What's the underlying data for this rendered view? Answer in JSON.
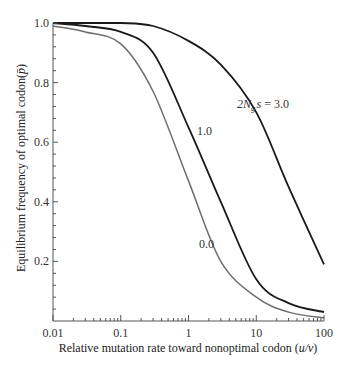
{
  "chart_data": {
    "type": "line",
    "title": "",
    "xlabel": "Relative mutation rate toward nonoptimal codon (u/v)",
    "ylabel": "Equilibrium frequency of optimal codon (p̄)",
    "xscale": "log",
    "xlim": [
      0.01,
      100
    ],
    "ylim": [
      0,
      1.0
    ],
    "x_ticks": [
      "0.01",
      "0.1",
      "1",
      "10",
      "100"
    ],
    "y_ticks": [
      "0.2",
      "0.4",
      "0.6",
      "0.8",
      "1.0"
    ],
    "grid": false,
    "legend": "inline curve labels",
    "x": [
      0.01,
      0.03,
      0.1,
      0.3,
      1,
      3,
      10,
      30,
      100
    ],
    "series": [
      {
        "name": "2Ngs = 3.0",
        "label": "2N_g s = 3.0",
        "values": [
          1.0,
          1.0,
          1.0,
          0.99,
          0.94,
          0.86,
          0.7,
          0.45,
          0.19
        ],
        "color": "#1a1a1a"
      },
      {
        "name": "1.0",
        "label": "1.0",
        "values": [
          1.0,
          0.99,
          0.97,
          0.9,
          0.65,
          0.4,
          0.14,
          0.06,
          0.03
        ],
        "color": "#1a1a1a"
      },
      {
        "name": "0.0",
        "label": "0.0",
        "values": [
          0.99,
          0.97,
          0.93,
          0.77,
          0.47,
          0.2,
          0.08,
          0.03,
          0.01
        ],
        "color": "#6e6e6e"
      }
    ]
  },
  "labels": {
    "curve_3": "2N",
    "curve_3_sub": "g",
    "curve_3_rest": "s = 3.0",
    "curve_1": "1.0",
    "curve_0": "0.0",
    "xlabel_main": "Relative mutation rate toward nonoptimal codon (",
    "xlabel_var": "u/v",
    "xlabel_end": ")",
    "ylabel_main": "Equilibrium frequency of optimal codon(",
    "ylabel_var": "p̄",
    "ylabel_end": ")"
  }
}
